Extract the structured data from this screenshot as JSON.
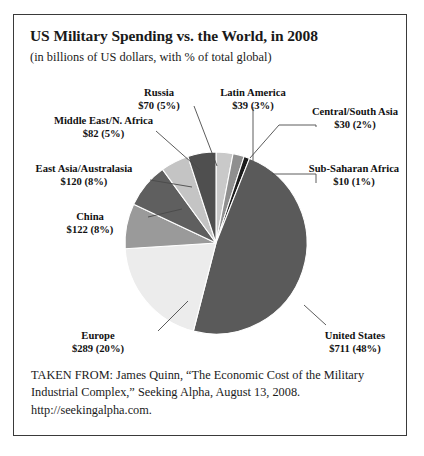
{
  "figure": {
    "title": "US Military Spending vs. the World, in 2008",
    "subtitle": "(in billions of US dollars, with % of total global)",
    "source_lines": [
      "TAKEN FROM: James Quinn, “The Economic Cost of the Military",
      "Industrial Complex,” Seeking Alpha, August 13, 2008.",
      "http://seekingalpha.com."
    ]
  },
  "chart_data": {
    "type": "pie",
    "title": "US Military Spending vs. the World, in 2008",
    "subtitle": "(in billions of US dollars, with % of total global)",
    "unit": "billions of US dollars",
    "start_angle_deg": 0,
    "direction": "clockwise",
    "legend": "none",
    "grid": false,
    "categories": [
      "Latin America",
      "Central/South Asia",
      "Sub-Saharan Africa",
      "United States",
      "Europe",
      "China",
      "East Asia/Australasia",
      "Middle East/N. Africa",
      "Russia"
    ],
    "values": [
      39,
      30,
      10,
      711,
      289,
      122,
      120,
      82,
      70
    ],
    "percents": [
      3,
      2,
      1,
      48,
      20,
      8,
      8,
      5,
      5
    ],
    "colors": [
      "#c9c9c9",
      "#8f8f8f",
      "#1c1c1c",
      "#5a5a5a",
      "#ececec",
      "#9a9a9a",
      "#5f5f5f",
      "#c4c4c4",
      "#4f4f4f"
    ],
    "slices": [
      {
        "name": "Latin America",
        "value_label": "$39 (3%)",
        "value": 39,
        "percent": 3,
        "color": "#c9c9c9"
      },
      {
        "name": "Central/South Asia",
        "value_label": "$30 (2%)",
        "value": 30,
        "percent": 2,
        "color": "#8f8f8f"
      },
      {
        "name": "Sub-Saharan Africa",
        "value_label": "$10 (1%)",
        "value": 10,
        "percent": 1,
        "color": "#1c1c1c"
      },
      {
        "name": "United States",
        "value_label": "$711 (48%)",
        "value": 711,
        "percent": 48,
        "color": "#5a5a5a"
      },
      {
        "name": "Europe",
        "value_label": "$289 (20%)",
        "value": 289,
        "percent": 20,
        "color": "#ececec"
      },
      {
        "name": "China",
        "value_label": "$122 (8%)",
        "value": 122,
        "percent": 8,
        "color": "#9a9a9a"
      },
      {
        "name": "East Asia/Australasia",
        "value_label": "$120 (8%)",
        "value": 120,
        "percent": 8,
        "color": "#5f5f5f"
      },
      {
        "name": "Middle East/N. Africa",
        "value_label": "$82 (5%)",
        "value": 82,
        "percent": 5,
        "color": "#c4c4c4"
      },
      {
        "name": "Russia",
        "value_label": "$70 (5%)",
        "value": 70,
        "percent": 5,
        "color": "#4f4f4f"
      }
    ]
  },
  "labels": {
    "russia": {
      "name": "Russia",
      "value": "$70 (5%)"
    },
    "latin_america": {
      "name": "Latin America",
      "value": "$39 (3%)"
    },
    "central_south_asia": {
      "name": "Central/South Asia",
      "value": "$30 (2%)"
    },
    "middle_east_n_africa": {
      "name": "Middle East/N. Africa",
      "value": "$82 (5%)"
    },
    "sub_saharan_africa": {
      "name": "Sub-Saharan Africa",
      "value": "$10 (1%)"
    },
    "east_asia_australasia": {
      "name": "East Asia/Australasia",
      "value": "$120 (8%)"
    },
    "china": {
      "name": "China",
      "value": "$122 (8%)"
    },
    "europe": {
      "name": "Europe",
      "value": "$289 (20%)"
    },
    "united_states": {
      "name": "United States",
      "value": "$711 (48%)"
    }
  }
}
